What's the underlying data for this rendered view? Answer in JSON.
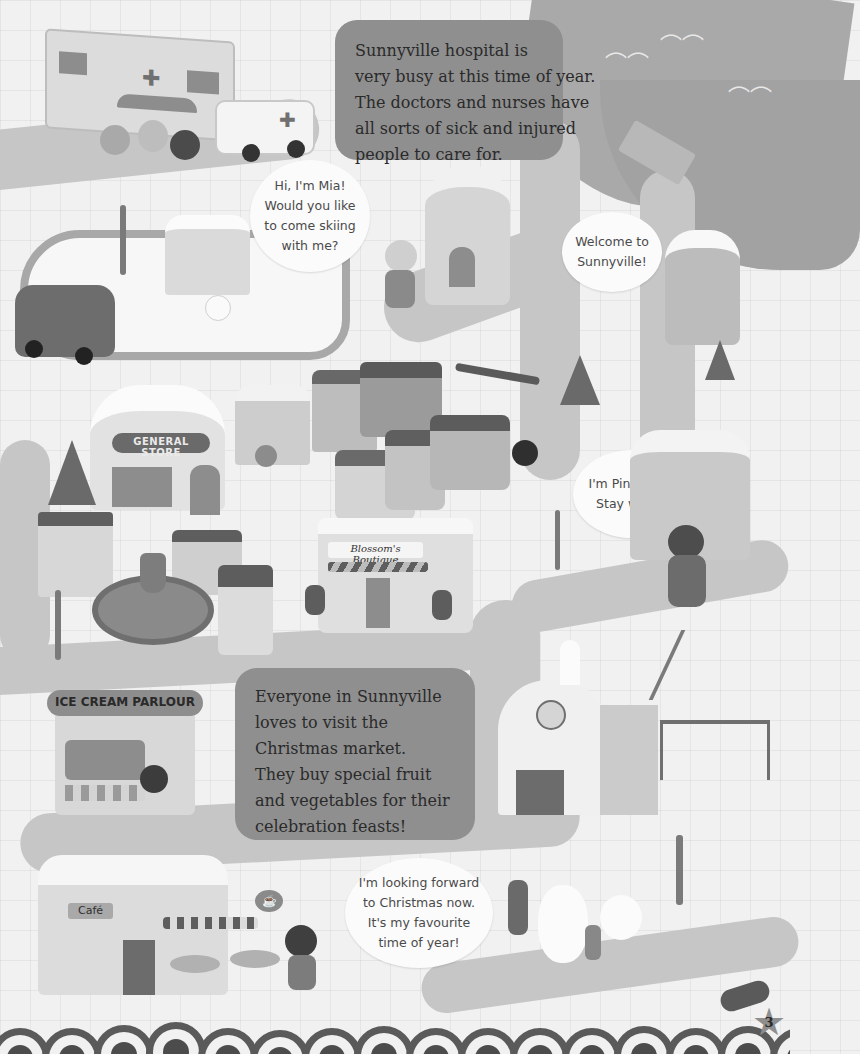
{
  "page": {
    "page_number": "3"
  },
  "narration": {
    "hospital": {
      "lines": [
        "Sunnyville hospital is",
        "very busy at this time of year.",
        "The doctors and nurses have",
        "all sorts of sick and injured",
        "people to care for."
      ]
    },
    "market": {
      "lines": [
        "Everyone in Sunnyville",
        "loves to visit the",
        "Christmas market.",
        "They buy special fruit",
        "and vegetables for their",
        "celebration feasts!"
      ]
    }
  },
  "speech_bubbles": {
    "mia": {
      "lines": [
        "Hi, I'm Mia!",
        "Would you like",
        "to come skiing",
        "with me?"
      ]
    },
    "welcome": {
      "lines": [
        "Welcome to",
        "Sunnyville!"
      ]
    },
    "pinkerton": {
      "lines": [
        "I'm Pinkerton!",
        "Stay warm!"
      ]
    },
    "beaver": {
      "lines": [
        "I'm looking forward",
        "to Christmas now.",
        "It's my favourite",
        "time of year!"
      ]
    }
  },
  "signs": {
    "general_store": "GENERAL STORE",
    "boutique": "Blossom's Boutique",
    "ice_cream": "ICE CREAM PARLOUR",
    "cafe": "Café"
  },
  "icons": {
    "hospital_cross": "✚",
    "wave": "︵︵",
    "clock": "🕒",
    "star": "★",
    "cup": "☕"
  }
}
